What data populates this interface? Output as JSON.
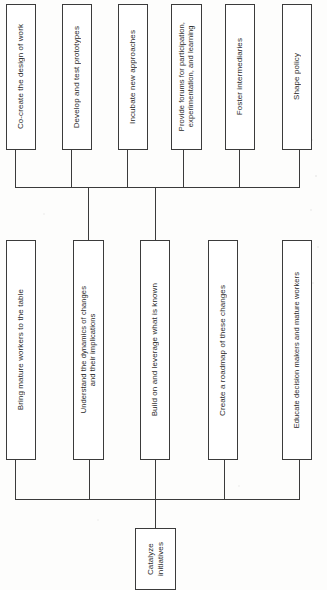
{
  "diagram": {
    "type": "hierarchy-tree",
    "orientation": "rotated-90-counterclockwise",
    "root": {
      "id": "catalyze-initiatives",
      "label": "Catalyze\ninitiatives"
    },
    "tier_middle": [
      {
        "id": "bring-mature-workers",
        "label": "Bring mature workers to the table"
      },
      {
        "id": "understand-dynamics",
        "label": "Understand the dynamics of changes\nand their implications"
      },
      {
        "id": "build-on-leverage",
        "label": "Build on and leverage what is known"
      },
      {
        "id": "create-roadmap",
        "label": "Create a roadmap of these changes"
      },
      {
        "id": "educate-decision-makers",
        "label": "Educate decision makers and mature workers"
      }
    ],
    "tier_top": [
      {
        "id": "co-create-design",
        "label": "Co-create the design of work"
      },
      {
        "id": "develop-test-prototypes",
        "label": "Develop and test prototypes"
      },
      {
        "id": "incubate-new-approaches",
        "label": "Incubate new approaches"
      },
      {
        "id": "provide-forums",
        "label": "Provide forums for participation,\nexperimentation, and learning"
      },
      {
        "id": "foster-intermediaries",
        "label": "Foster intermediaries"
      },
      {
        "id": "shape-policy",
        "label": "Shape policy"
      }
    ],
    "colors": {
      "ink": "#3b3b3b",
      "text": "#2a2a2a",
      "paper": "#fdfdfc",
      "node_fill": "#ffffff"
    }
  }
}
